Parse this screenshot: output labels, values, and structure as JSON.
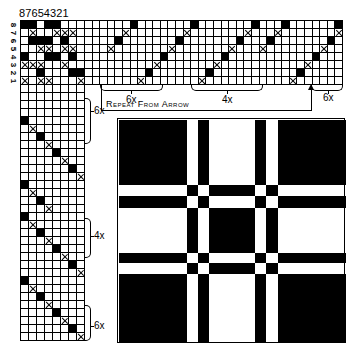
{
  "header": {
    "shaft_numbers": "87654321",
    "row_labels": [
      "8",
      "7",
      "6",
      "5",
      "4",
      "3",
      "2",
      "1"
    ]
  },
  "tieup": {
    "legend": {
      "b": "filled square",
      "x": "crossed square",
      "o": "empty"
    },
    "rows_top_to_bottom": [
      "bbobbooo",
      "oxooxxxo",
      "obbbobooo",
      "ooxxoxxo",
      "boobboboo",
      "xxxooxoo",
      "oobooobbb",
      "xoxxooox"
    ]
  },
  "threading": {
    "columns": 34,
    "rows": 8,
    "sequence_bottom_row_is_1": [
      {
        "col": 0,
        "row": 0
      },
      {
        "col": 1,
        "row": 0
      },
      {
        "col": 2,
        "row": 0
      },
      {
        "col": 3,
        "row": 5,
        "m": "x"
      },
      {
        "col": 4,
        "row": 6,
        "m": "b"
      },
      {
        "col": 5,
        "row": 7,
        "m": "x"
      },
      {
        "col": 6,
        "row": 8,
        "m": "b"
      },
      {
        "col": 7,
        "row": 1,
        "m": "x"
      },
      {
        "col": 8,
        "row": 2,
        "m": "b"
      },
      {
        "col": 9,
        "row": 3,
        "m": "x"
      },
      {
        "col": 10,
        "row": 4,
        "m": "b"
      },
      {
        "col": 11,
        "row": 5,
        "m": "x"
      },
      {
        "col": 12,
        "row": 6,
        "m": "b"
      },
      {
        "col": 13,
        "row": 7,
        "m": "x"
      },
      {
        "col": 14,
        "row": 8,
        "m": "b"
      },
      {
        "col": 15,
        "row": 1,
        "m": "x"
      },
      {
        "col": 16,
        "row": 2,
        "m": "b"
      },
      {
        "col": 17,
        "row": 3,
        "m": "x"
      },
      {
        "col": 18,
        "row": 4,
        "m": "b"
      },
      {
        "col": 19,
        "row": 5,
        "m": "x"
      },
      {
        "col": 20,
        "row": 6,
        "m": "b"
      },
      {
        "col": 21,
        "row": 7,
        "m": "x"
      },
      {
        "col": 22,
        "row": 8,
        "m": "b"
      },
      {
        "col": 23,
        "row": 5,
        "m": "x"
      },
      {
        "col": 24,
        "row": 6,
        "m": "b"
      },
      {
        "col": 25,
        "row": 7,
        "m": "x"
      },
      {
        "col": 26,
        "row": 8,
        "m": "b"
      },
      {
        "col": 27,
        "row": 1,
        "m": "x"
      },
      {
        "col": 28,
        "row": 2,
        "m": "b"
      },
      {
        "col": 29,
        "row": 3,
        "m": "x"
      },
      {
        "col": 30,
        "row": 4,
        "m": "b"
      },
      {
        "col": 31,
        "row": 5,
        "m": "x"
      },
      {
        "col": 32,
        "row": 6,
        "m": "b"
      },
      {
        "col": 33,
        "row": 7,
        "m": "x"
      }
    ],
    "extra": [
      {
        "col": 33,
        "row": 8,
        "m": "b"
      }
    ],
    "brackets": [
      {
        "label": "6x",
        "from_col": 0,
        "to_col": 10
      },
      {
        "label": "4x",
        "from_col": 24,
        "to_col": 34
      },
      {
        "label": "6x",
        "from_col": 45,
        "to_col": 56
      }
    ],
    "repeat_text": "Repeat From Arrow"
  },
  "treadling": {
    "columns": 8,
    "rows": 32,
    "sequence_top_to_bottom": [
      {
        "r": 0,
        "c": -1
      },
      {
        "r": 1,
        "c": -1
      },
      {
        "r": 2,
        "c": -1
      },
      {
        "r": 3,
        "c": -1
      },
      {
        "r": 4,
        "c": 1,
        "m": "b"
      },
      {
        "r": 5,
        "c": 2,
        "m": "x"
      },
      {
        "r": 6,
        "c": 3,
        "m": "b"
      },
      {
        "r": 7,
        "c": 4,
        "m": "x"
      },
      {
        "r": 8,
        "c": 5,
        "m": "b"
      },
      {
        "r": 9,
        "c": 6,
        "m": "x"
      },
      {
        "r": 10,
        "c": 7,
        "m": "b"
      },
      {
        "r": 11,
        "c": 8,
        "m": "x"
      },
      {
        "r": 12,
        "c": 1,
        "m": "b"
      },
      {
        "r": 13,
        "c": 2,
        "m": "x"
      },
      {
        "r": 14,
        "c": 3,
        "m": "b"
      },
      {
        "r": 15,
        "c": 4,
        "m": "x"
      },
      {
        "r": 16,
        "c": 1,
        "m": "b"
      },
      {
        "r": 17,
        "c": 2,
        "m": "x"
      },
      {
        "r": 18,
        "c": 3,
        "m": "b"
      },
      {
        "r": 19,
        "c": 4,
        "m": "x"
      },
      {
        "r": 20,
        "c": 5,
        "m": "b"
      },
      {
        "r": 21,
        "c": 6,
        "m": "x"
      },
      {
        "r": 22,
        "c": 7,
        "m": "b"
      },
      {
        "r": 23,
        "c": 8,
        "m": "x"
      },
      {
        "r": 24,
        "c": 1,
        "m": "b"
      },
      {
        "r": 25,
        "c": 2,
        "m": "x"
      },
      {
        "r": 26,
        "c": 3,
        "m": "b"
      },
      {
        "r": 27,
        "c": 4,
        "m": "x"
      },
      {
        "r": 28,
        "c": 5,
        "m": "b"
      },
      {
        "r": 29,
        "c": 6,
        "m": "x"
      },
      {
        "r": 30,
        "c": 7,
        "m": "b"
      },
      {
        "r": 31,
        "c": 8,
        "m": "x"
      }
    ],
    "brackets": [
      {
        "label": "6x",
        "y": "top"
      },
      {
        "label": "4x",
        "y": "middle"
      },
      {
        "label": "6x",
        "y": "bottom"
      }
    ]
  },
  "drawdown": {
    "bounds_px": {
      "x0": 117,
      "y0": 118,
      "x1": 345,
      "y1": 343
    },
    "vertical_bands_px": [
      118,
      186,
      197,
      208,
      254,
      265,
      277,
      345
    ],
    "horizontal_bands_px": [
      119,
      184,
      195,
      207,
      252,
      262,
      273,
      342
    ],
    "band_colors_v": [
      "black",
      "white",
      "black",
      "white",
      "black",
      "white",
      "black"
    ],
    "band_colors_h": [
      "black",
      "white",
      "black",
      "white",
      "black",
      "white",
      "black"
    ]
  }
}
